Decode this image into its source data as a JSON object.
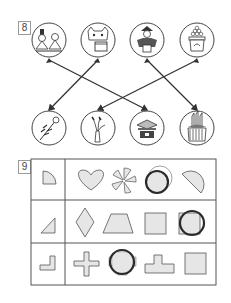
{
  "question8": {
    "number": "8",
    "top_items": [
      {
        "name": "hina-dolls",
        "cx": 49,
        "cy": 40
      },
      {
        "name": "oni-mask-bean-box",
        "cx": 98,
        "cy": 40
      },
      {
        "name": "may-dolls-warrior",
        "cx": 147,
        "cy": 40
      },
      {
        "name": "moon-dango",
        "cx": 197,
        "cy": 40
      }
    ],
    "bottom_items": [
      {
        "name": "peach-blossom",
        "cx": 49,
        "cy": 128
      },
      {
        "name": "susuki-grass-vase",
        "cx": 98,
        "cy": 128
      },
      {
        "name": "iris-kabuto-box",
        "cx": 147,
        "cy": 128
      },
      {
        "name": "kadomatsu",
        "cx": 197,
        "cy": 128
      }
    ],
    "connections": [
      {
        "from": "hina-dolls",
        "to": "iris-kabuto-box"
      },
      {
        "from": "oni-mask-bean-box",
        "to": "peach-blossom"
      },
      {
        "from": "may-dolls-warrior",
        "to": "kadomatsu"
      },
      {
        "from": "moon-dango",
        "to": "susuki-grass-vase"
      }
    ]
  },
  "question9": {
    "number": "9",
    "rows": [
      {
        "piece": "quarter-circle",
        "options": [
          "heart",
          "pinwheel-pieces",
          "circle",
          "semicircle"
        ],
        "answer_index": 2
      },
      {
        "piece": "right-triangle",
        "options": [
          "diamond",
          "trapezoid",
          "square",
          "square-with-circle"
        ],
        "answer_index": 3
      },
      {
        "piece": "l-shape",
        "options": [
          "cross",
          "plus-square",
          "t-shape",
          "square"
        ],
        "answer_index": 1
      }
    ]
  },
  "colors": {
    "line": "#333333",
    "fill": "#e6e6e6",
    "border": "#555555",
    "answer_circle": "#2a2a2a"
  }
}
